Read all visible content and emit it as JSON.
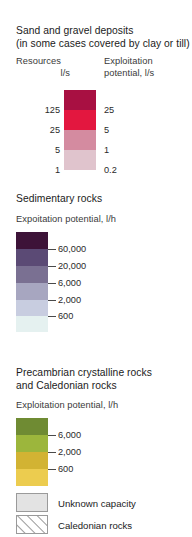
{
  "legend": {
    "sections": [
      {
        "id": "sand-gravel",
        "title_line1": "Sand and gravel deposits",
        "title_line2": "(in some cases covered by clay or till)",
        "col_left_line1": "Resources",
        "col_left_line2": "l/s",
        "col_right_line1": "Exploitation",
        "col_right_line2": "potential, l/s",
        "left_labels": [
          "125",
          "25",
          "5",
          "1"
        ],
        "right_labels": [
          "25",
          "5",
          "1",
          "0.2"
        ],
        "colors": [
          "#a81042",
          "#e3173f",
          "#d48ba0",
          "#e0c4cd"
        ]
      },
      {
        "id": "sedimentary-rocks",
        "title_line1": "Sedimentary rocks",
        "sub_head": "Expoitation potential, l/h",
        "labels": [
          "60,000",
          "20,000",
          "6,000",
          "2,000",
          "600"
        ],
        "colors": [
          "#3d1338",
          "#5b4a75",
          "#7a7092",
          "#a7a6c0",
          "#c8cde0",
          "#e5f1f0"
        ]
      },
      {
        "id": "precambrian-caledonian",
        "title_line1": "Precambrian crystalline rocks",
        "title_line2": "and Caledonian rocks",
        "sub_head": "Exploitation potential, l/h",
        "labels": [
          "6,000",
          "2,000",
          "600"
        ],
        "colors": [
          "#6f8b33",
          "#9cb63c",
          "#d2b333",
          "#eccc4f"
        ]
      }
    ],
    "extra_keys": [
      {
        "id": "unknown-capacity",
        "label": "Unknown capacity",
        "fill": "#e3e3e3",
        "pattern": "solid"
      },
      {
        "id": "caledonian-rocks",
        "label": "Caledonian rocks",
        "fill": "#ffffff",
        "pattern": "diagonal-hatch"
      }
    ]
  }
}
